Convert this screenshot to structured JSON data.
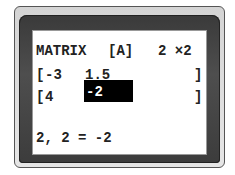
{
  "screen": {
    "header": {
      "label": "MATRIX",
      "name": "[A]",
      "dims": "2 ×2"
    },
    "rows": [
      {
        "open": "[",
        "cells": [
          "-3",
          "1.5"
        ],
        "close": "]"
      },
      {
        "open": "[",
        "cells": [
          "4",
          "-2"
        ],
        "close": "]"
      }
    ],
    "selected_cell": {
      "row": 2,
      "col": 2,
      "value": "-2"
    },
    "status_line": "2, 2 = -2"
  }
}
